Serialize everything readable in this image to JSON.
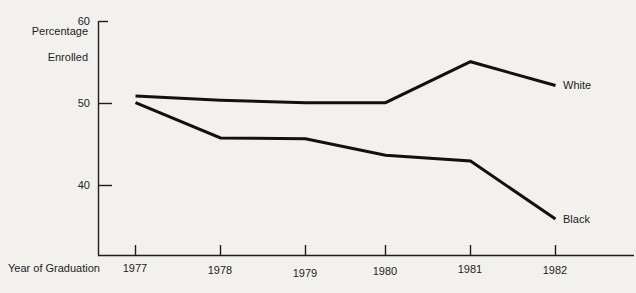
{
  "chart_data": {
    "type": "line",
    "title": "",
    "xlabel": "Year of Graduation",
    "ylabel": "Percentage Enrolled",
    "ylabel_line1": "Percentage",
    "ylabel_line2": "Enrolled",
    "categories": [
      "1977",
      "1978",
      "1979",
      "1980",
      "1981",
      "1982"
    ],
    "x": [
      1977,
      1978,
      1979,
      1980,
      1981,
      1982
    ],
    "ylim": [
      31,
      60
    ],
    "xlim": [
      1976.4,
      1982.6
    ],
    "yticks": [
      40,
      50,
      60
    ],
    "ytick_labels": [
      "40",
      "50",
      "60"
    ],
    "grid": false,
    "legend_position": "right-inline-end-of-line",
    "series": [
      {
        "name": "White",
        "label": "White",
        "color": "#111111",
        "values": [
          50.9,
          50.4,
          50.1,
          50.1,
          55.1,
          52.2
        ]
      },
      {
        "name": "Black",
        "label": "Black",
        "color": "#111111",
        "values": [
          50.1,
          45.8,
          45.7,
          43.7,
          43.0,
          35.9
        ]
      }
    ]
  },
  "axes": {
    "y_title_line1": "Percentage",
    "y_title_line2": "Enrolled",
    "x_title": "Year of Graduation"
  },
  "ticks": {
    "y": [
      "60",
      "50",
      "40"
    ],
    "x": [
      "1977",
      "1978",
      "1979",
      "1980",
      "1981",
      "1982"
    ]
  },
  "labels": {
    "white": "White",
    "black": "Black"
  },
  "colors": {
    "background": "#f3f1ee",
    "ink": "#1d1d1d",
    "line": "#111111"
  }
}
